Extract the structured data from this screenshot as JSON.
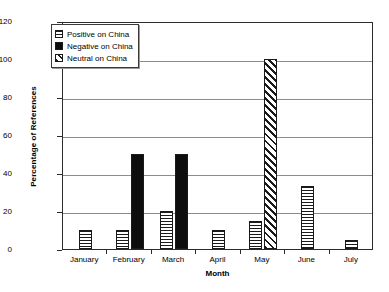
{
  "chart_data": {
    "type": "bar",
    "title": "",
    "xlabel": "Month",
    "ylabel": "Percentage of References",
    "categories": [
      "January",
      "February",
      "March",
      "April",
      "May",
      "June",
      "July"
    ],
    "series": [
      {
        "name": "Positive on China",
        "pattern": "horizontal-lines",
        "values": [
          10,
          10,
          20,
          10,
          15,
          33,
          5
        ]
      },
      {
        "name": "Negative on China",
        "pattern": "solid-black",
        "values": [
          0,
          50,
          50,
          0,
          0,
          0,
          0
        ]
      },
      {
        "name": "Neutral on China",
        "pattern": "diagonal-hatch",
        "values": [
          0,
          0,
          0,
          0,
          100,
          0,
          0
        ]
      }
    ],
    "ylim": [
      0,
      120
    ],
    "yticks": [
      0,
      20,
      40,
      60,
      80,
      100,
      120
    ],
    "ytick_labels": [
      "0",
      "20",
      "40",
      "60",
      "80",
      "100",
      "120"
    ],
    "grid": true,
    "legend_position": "top-left",
    "colors": {
      "axis": "#2b2b2b",
      "gridline": "#8c8c8c",
      "bar_outline": "#1a1a1a",
      "negative_fill": "#0d0d0d",
      "background": "#ffffff"
    }
  },
  "legend": {
    "items": [
      {
        "label": "Positive on China"
      },
      {
        "label": "Negative on China"
      },
      {
        "label": "Neutral on China"
      }
    ]
  }
}
